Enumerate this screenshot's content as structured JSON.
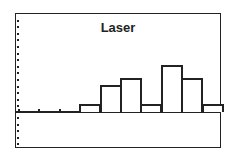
{
  "chart_data": {
    "type": "bar",
    "title": "Laser",
    "subtype": "histogram",
    "style": "graphing-calculator screen",
    "xlabel": "",
    "ylabel": "",
    "bins_before_data_empty": 3,
    "categories": [
      "bin1",
      "bin2",
      "bin3",
      "bin4",
      "bin5",
      "bin6",
      "bin7"
    ],
    "values": [
      1,
      4,
      5,
      1,
      7,
      5,
      1
    ],
    "grid": false,
    "legend": null,
    "y_tick_spacing_units": 1
  },
  "screen": {
    "title": "Laser"
  }
}
